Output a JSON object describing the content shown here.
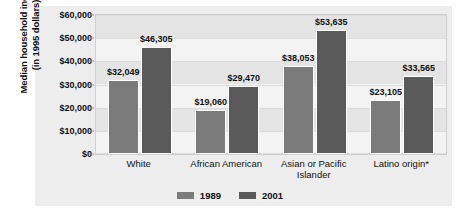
{
  "chart_data": {
    "type": "bar",
    "title": "",
    "subtitle": "",
    "xlabel": "",
    "ylabel": "Median household income\n(in 1995 dollars)",
    "ylabel_line1": "Median household income",
    "ylabel_line2": "(in 1995 dollars)",
    "ylim": [
      0,
      60000
    ],
    "ytick_values": [
      0,
      10000,
      20000,
      30000,
      40000,
      50000,
      60000
    ],
    "ytick_labels": [
      "$0",
      "$10,000",
      "$20,000",
      "$30,000",
      "$40,000",
      "$50,000",
      "$60,000"
    ],
    "grid": true,
    "legend_position": "bottom",
    "categories": [
      "White",
      "African American",
      "Asian or Pacific\nIslander",
      "Latino origin*"
    ],
    "category_labels": [
      "White",
      "African American",
      "Asian or Pacific Islander",
      "Latino origin*"
    ],
    "series": [
      {
        "name": "1989",
        "color": "#7b7b7b",
        "values": [
          32049,
          19060,
          38053,
          23105
        ],
        "value_labels": [
          "$32,049",
          "$19,060",
          "$38,053",
          "$23,105"
        ]
      },
      {
        "name": "2001",
        "color": "#5a5a5a",
        "values": [
          46305,
          29470,
          53635,
          33565
        ],
        "value_labels": [
          "$46,305",
          "$29,470",
          "$53,635",
          "$33,565"
        ]
      }
    ]
  },
  "legend": {
    "items": [
      {
        "label": "1989",
        "color": "#7b7b7b"
      },
      {
        "label": "2001",
        "color": "#5a5a5a"
      }
    ]
  }
}
